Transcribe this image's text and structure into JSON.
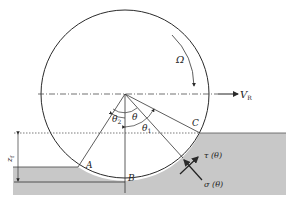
{
  "diagram": {
    "labels": {
      "omega": "Ω",
      "velocity": "V",
      "velocity_sub": "R",
      "theta": "θ",
      "theta1": "θ",
      "theta1_sub": "1",
      "theta2": "θ",
      "theta2_sub": "2",
      "point_a": "A",
      "point_b": "B",
      "point_c": "C",
      "sinkage": "z",
      "sinkage_sub": "f",
      "shear_stress": "τ (θ)",
      "normal_stress": "σ (θ)"
    },
    "colors": {
      "soil": "#c8c8c8",
      "line": "#2a2a2a",
      "background": "#ffffff"
    }
  }
}
